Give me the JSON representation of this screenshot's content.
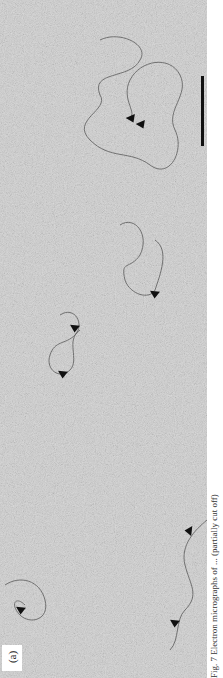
{
  "figure": {
    "panel_label": "(a)",
    "scale_bar": {
      "x": 204,
      "y1": 76,
      "y2": 146,
      "color": "#111111"
    },
    "background_color": "#cfcfcf",
    "molecules": [
      {
        "cx": 145,
        "cy": 120,
        "arrowheads": [
          [
            128,
            116
          ],
          [
            138,
            122
          ]
        ]
      },
      {
        "cx": 140,
        "cy": 265,
        "arrowheads": [
          [
            155,
            292
          ]
        ]
      },
      {
        "cx": 60,
        "cy": 340,
        "arrowheads": [
          [
            75,
            326
          ],
          [
            64,
            372
          ]
        ]
      },
      {
        "cx": 30,
        "cy": 600,
        "arrowheads": [
          [
            22,
            608
          ]
        ]
      },
      {
        "cx": 190,
        "cy": 560,
        "arrowheads": [
          [
            215,
            530
          ],
          [
            176,
            621
          ]
        ]
      }
    ],
    "caption_partial": "Fig. 7  Electron micrographs of ... (partially cut off)"
  }
}
